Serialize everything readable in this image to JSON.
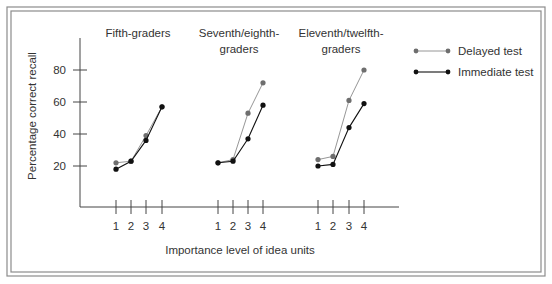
{
  "chart_data": {
    "type": "line",
    "title": "",
    "xlabel": "Importance level of idea units",
    "ylabel": "Percentage correct recall",
    "ylim": [
      0,
      100
    ],
    "yticks": [
      20,
      40,
      60,
      80
    ],
    "grid": false,
    "legend_position": "top-right",
    "categories": [
      "1",
      "2",
      "3",
      "4"
    ],
    "panels": [
      {
        "title_lines": [
          "Fifth-graders"
        ],
        "series": [
          {
            "name": "Delayed test",
            "values": [
              22,
              23,
              39,
              57
            ]
          },
          {
            "name": "Immediate test",
            "values": [
              18,
              23,
              36,
              57
            ]
          }
        ]
      },
      {
        "title_lines": [
          "Seventh/eighth-",
          "graders"
        ],
        "series": [
          {
            "name": "Delayed test",
            "values": [
              22,
              24,
              53,
              72
            ]
          },
          {
            "name": "Immediate test",
            "values": [
              22,
              23,
              37,
              58
            ]
          }
        ]
      },
      {
        "title_lines": [
          "Eleventh/twelfth-",
          "graders"
        ],
        "series": [
          {
            "name": "Delayed test",
            "values": [
              24,
              26,
              61,
              80
            ]
          },
          {
            "name": "Immediate test",
            "values": [
              20,
              21,
              44,
              59
            ]
          }
        ]
      }
    ],
    "legend": [
      {
        "name": "Delayed test",
        "color": "#6e6e6e"
      },
      {
        "name": "Immediate test",
        "color": "#111111"
      }
    ]
  },
  "colors": {
    "delayed": "#6e6e6e",
    "delayed_line": "#8a8a8a",
    "immediate": "#111111",
    "axis": "#444444",
    "border": "#8c8c8c",
    "text": "#333333"
  }
}
